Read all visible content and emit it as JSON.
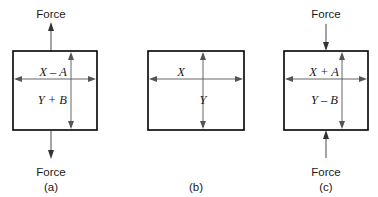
{
  "figure": {
    "background_color": "#ffffff",
    "line_color": "#000000",
    "dimension_color": "#555555",
    "panels": [
      {
        "caption": "(a)",
        "state": "tension",
        "force_label_top": "Force",
        "force_label_bottom": "Force",
        "arrow_top_direction": "up",
        "arrow_bottom_direction": "down",
        "width_label": "X – A",
        "height_label": "Y + B"
      },
      {
        "caption": "(b)",
        "state": "unloaded",
        "force_label_top": "",
        "force_label_bottom": "",
        "arrow_top_direction": "none",
        "arrow_bottom_direction": "none",
        "width_label": "X",
        "height_label": "Y"
      },
      {
        "caption": "(c)",
        "state": "compression",
        "force_label_top": "Force",
        "force_label_bottom": "Force",
        "arrow_top_direction": "down",
        "arrow_bottom_direction": "up",
        "width_label": "X + A",
        "height_label": "Y – B"
      }
    ]
  }
}
